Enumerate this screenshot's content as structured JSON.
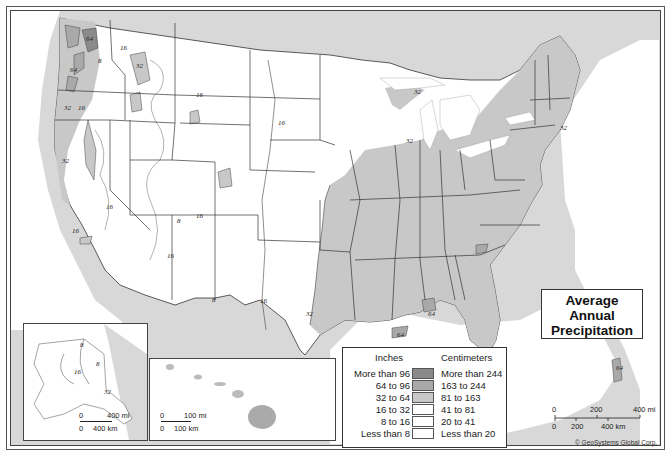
{
  "map": {
    "title_lines": [
      "Average",
      "Annual",
      "Precipitation"
    ],
    "copyright": "© GeoSystems Global Corp.",
    "colors": {
      "more_than_96": "#8a8a8a",
      "64_to_96": "#a9a9a9",
      "32_to_64": "#c8c8c8",
      "16_to_32": "#ffffff",
      "8_to_16": "#ffffff",
      "less_than_8": "#ffffff",
      "water": "#ffffff",
      "foreign_land": "#d8d8d8"
    },
    "legend": {
      "header_inches": "Inches",
      "header_cm": "Centimeters",
      "rows": [
        {
          "inches": "More than 96",
          "cm": "More than 244",
          "color": "#8a8a8a"
        },
        {
          "inches": "64 to 96",
          "cm": "163 to 244",
          "color": "#a9a9a9"
        },
        {
          "inches": "32 to 64",
          "cm": "81 to 163",
          "color": "#c8c8c8"
        },
        {
          "inches": "16 to 32",
          "cm": "41 to 81",
          "color": "#ffffff"
        },
        {
          "inches": "8 to 16",
          "cm": "20 to 41",
          "color": "#ffffff"
        },
        {
          "inches": "Less than 8",
          "cm": "Less than 20",
          "color": "#ffffff"
        }
      ]
    },
    "main_scale": {
      "mi_labels": [
        "0",
        "200",
        "400 mi"
      ],
      "km_labels": [
        "0",
        "200",
        "400 km"
      ]
    },
    "alaska_inset": {
      "scale": {
        "mi_labels": [
          "0",
          "400 mi"
        ],
        "km_labels": [
          "0",
          "400 km"
        ]
      },
      "contour_labels": [
        "8",
        "8",
        "16",
        "32"
      ]
    },
    "hawaii_inset": {
      "scale": {
        "mi_labels": [
          "0",
          "100 mi"
        ],
        "km_labels": [
          "0",
          "100 km"
        ]
      }
    },
    "contour_labels": [
      {
        "text": "64",
        "x": 86,
        "y": 41
      },
      {
        "text": "64",
        "x": 70,
        "y": 72
      },
      {
        "text": "32",
        "x": 64,
        "y": 110
      },
      {
        "text": "16",
        "x": 78,
        "y": 110
      },
      {
        "text": "16",
        "x": 120,
        "y": 50
      },
      {
        "text": "32",
        "x": 136,
        "y": 68
      },
      {
        "text": "8",
        "x": 98,
        "y": 63
      },
      {
        "text": "16",
        "x": 196,
        "y": 97
      },
      {
        "text": "16",
        "x": 278,
        "y": 125
      },
      {
        "text": "32",
        "x": 414,
        "y": 94
      },
      {
        "text": "32",
        "x": 406,
        "y": 143
      },
      {
        "text": "32",
        "x": 560,
        "y": 130
      },
      {
        "text": "16",
        "x": 106,
        "y": 209
      },
      {
        "text": "16",
        "x": 72,
        "y": 233
      },
      {
        "text": "32",
        "x": 62,
        "y": 163
      },
      {
        "text": "16",
        "x": 196,
        "y": 218
      },
      {
        "text": "16",
        "x": 167,
        "y": 258
      },
      {
        "text": "8",
        "x": 177,
        "y": 223
      },
      {
        "text": "8",
        "x": 212,
        "y": 302
      },
      {
        "text": "16",
        "x": 260,
        "y": 303
      },
      {
        "text": "32",
        "x": 306,
        "y": 316
      },
      {
        "text": "64",
        "x": 428,
        "y": 316
      },
      {
        "text": "64",
        "x": 397,
        "y": 337
      },
      {
        "text": "64",
        "x": 616,
        "y": 370
      }
    ]
  }
}
